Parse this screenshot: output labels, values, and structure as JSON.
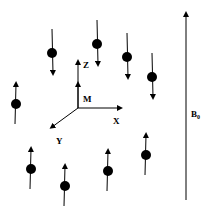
{
  "diagram": {
    "labels": {
      "z_axis": "Z",
      "x_axis": "X",
      "y_axis": "Y",
      "magnetization": "M",
      "field": "B",
      "field_subscript": "0"
    },
    "spins": [
      {
        "id": "spin-1",
        "direction": "down"
      },
      {
        "id": "spin-2",
        "direction": "down"
      },
      {
        "id": "spin-3",
        "direction": "down"
      },
      {
        "id": "spin-4",
        "direction": "down"
      },
      {
        "id": "spin-5",
        "direction": "up"
      },
      {
        "id": "spin-6",
        "direction": "up"
      },
      {
        "id": "spin-7",
        "direction": "up"
      },
      {
        "id": "spin-8",
        "direction": "up"
      },
      {
        "id": "spin-9",
        "direction": "up"
      }
    ],
    "colors": {
      "ink": "#000000",
      "background": "#ffffff"
    }
  }
}
